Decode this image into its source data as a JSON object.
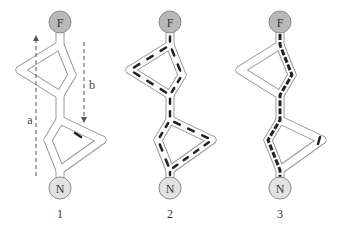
{
  "figure": {
    "panels": [
      {
        "label": "1",
        "top_node": "F",
        "bottom_node": "N",
        "arrows": [
          {
            "label": "a",
            "direction": "up"
          },
          {
            "label": "b",
            "direction": "down"
          }
        ],
        "highlight": "single dash in lower loop"
      },
      {
        "label": "2",
        "top_node": "F",
        "bottom_node": "N",
        "arrows": [],
        "highlight": "dashes along all channels"
      },
      {
        "label": "3",
        "top_node": "F",
        "bottom_node": "N",
        "arrows": [],
        "highlight": "thick dashed shortest path F to N"
      }
    ],
    "colors": {
      "top_node_fill": "#b8b8b8",
      "bottom_node_fill": "#e2e2e2",
      "node_stroke": "#8a8a8a",
      "channel_stroke": "#9a9a9a",
      "dash": "#222222",
      "arrow": "#555555"
    }
  }
}
